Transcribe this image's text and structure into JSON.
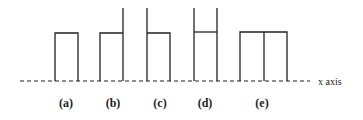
{
  "diagram": {
    "axis_label": "x axis",
    "panels": [
      {
        "id": "a",
        "label": "(a)",
        "description": "single rectangle resting on the axis"
      },
      {
        "id": "b",
        "label": "(b)",
        "description": "rectangle with right side extended upward"
      },
      {
        "id": "c",
        "label": "(c)",
        "description": "rectangle with left side extended upward"
      },
      {
        "id": "d",
        "label": "(d)",
        "description": "two tall verticals joined by a crossbar (H shape)"
      },
      {
        "id": "e",
        "label": "(e)",
        "description": "double-width rectangle divided by a central vertical"
      }
    ],
    "colors": {
      "line": "#222222",
      "background": "#ffffff"
    }
  }
}
